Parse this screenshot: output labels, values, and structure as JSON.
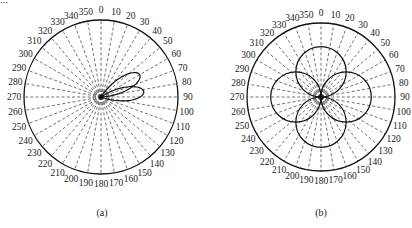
{
  "header": {
    "partial_text": "..."
  },
  "chart_data": [
    {
      "type": "polar",
      "id": "a",
      "caption": "(a)",
      "angle_ticks": [
        "0",
        "10",
        "20",
        "30",
        "40",
        "50",
        "60",
        "70",
        "80",
        "90",
        "100",
        "110",
        "120",
        "130",
        "140",
        "150",
        "160",
        "170",
        "180",
        "190",
        "200",
        "210",
        "220",
        "230",
        "240",
        "250",
        "260",
        "270",
        "280",
        "290",
        "300",
        "310",
        "320",
        "330",
        "340",
        "350"
      ],
      "angle_direction": "clockwise",
      "zero_location": "top",
      "grid": "dashed radial lines every 10 degrees",
      "series": [
        {
          "name": "pattern",
          "shape": "two lobes",
          "lobe_directions_deg": [
            60,
            83
          ],
          "lobe_relative_radius": [
            0.58,
            0.56
          ]
        }
      ]
    },
    {
      "type": "polar",
      "id": "b",
      "caption": "(b)",
      "angle_ticks": [
        "0",
        "10",
        "20",
        "30",
        "40",
        "50",
        "60",
        "70",
        "80",
        "90",
        "100",
        "110",
        "120",
        "130",
        "140",
        "150",
        "160",
        "170",
        "180",
        "190",
        "200",
        "210",
        "220",
        "230",
        "240",
        "250",
        "260",
        "270",
        "280",
        "290",
        "300",
        "310",
        "320",
        "330",
        "340",
        "350"
      ],
      "angle_direction": "clockwise",
      "zero_location": "top",
      "grid": "dashed radial lines every 10 degrees",
      "series": [
        {
          "name": "pattern",
          "shape": "four-petal (circles through origin)",
          "petal_directions_deg": [
            0,
            90,
            180,
            270
          ],
          "petal_relative_diameter": 0.68
        }
      ]
    }
  ],
  "labels": {
    "a": "(a)",
    "b": "(b)"
  }
}
